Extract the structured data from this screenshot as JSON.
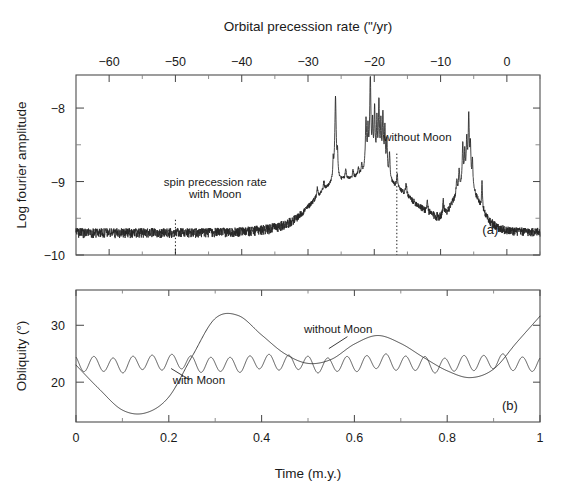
{
  "figure": {
    "top_axis_title": "Orbital precession rate (\"/yr)",
    "bottom_axis_title": "Time (m.y.)",
    "panel_a": {
      "label": "(a)",
      "ylabel": "Log fourier amplitude",
      "annotation_spin_line1": "spin precession rate",
      "annotation_spin_line2": "with Moon",
      "annotation_without_moon": "without Moon"
    },
    "panel_b": {
      "label": "(b)",
      "ylabel": "Obliquity (°)",
      "annotation_with_moon": "with Moon",
      "annotation_without_moon": "without Moon"
    }
  },
  "chart_data": [
    {
      "type": "line",
      "panel": "a",
      "title": "",
      "xlabel": "Orbital precession rate (\"/yr)",
      "ylabel": "Log fourier amplitude",
      "xlim": [
        -65,
        5
      ],
      "ylim": [
        -10,
        -7.55
      ],
      "xticks": [
        -60,
        -50,
        -40,
        -30,
        -20,
        -10,
        0
      ],
      "xtick_labels": [
        "−60",
        "−50",
        "−40",
        "−30",
        "−20",
        "−10",
        "0"
      ],
      "yticks": [
        -8,
        -9,
        -10
      ],
      "ytick_labels": [
        "−8",
        "−9",
        "−10"
      ],
      "yminor": [
        -8.5,
        -9.5
      ],
      "grid": false,
      "legend": null,
      "annotations": [
        {
          "text": "spin precession rate",
          "x": -44.0,
          "y": -9.06
        },
        {
          "text": "with Moon",
          "x": -44.0,
          "y": -9.22
        },
        {
          "text": "without Moon",
          "x": -13.5,
          "y": -8.45
        },
        {
          "text": "(a)",
          "x": -2.5,
          "y": -9.72
        }
      ],
      "vertical_dotted_lines": [
        {
          "name": "spin-precession-with-moon",
          "x": -50.0,
          "y_top": -9.52,
          "y_bottom": -10.0
        },
        {
          "name": "spin-precession-without-moon",
          "x": -16.6,
          "y_top": -8.62,
          "y_bottom": -10.0
        }
      ],
      "series": [
        {
          "name": "fourier-spectrum",
          "comment": "log fourier amplitude of orbital precession spectrum; peak cluster near -26, -21 to -18 and -7 to -5",
          "peaks": [
            {
              "x": -25.8,
              "y": -8.22
            },
            {
              "x": -20.6,
              "y": -7.82
            },
            {
              "x": -19.9,
              "y": -8.35
            },
            {
              "x": -19.2,
              "y": -8.15
            },
            {
              "x": -18.6,
              "y": -8.55
            },
            {
              "x": -6.6,
              "y": -8.7
            },
            {
              "x": -5.7,
              "y": -8.28
            },
            {
              "x": -3.7,
              "y": -9.42
            }
          ],
          "baseline": -10.0
        }
      ]
    },
    {
      "type": "line",
      "panel": "b",
      "title": "",
      "xlabel": "Time (m.y.)",
      "ylabel": "Obliquity (°)",
      "xlim": [
        0,
        1
      ],
      "ylim": [
        13.0,
        36.2
      ],
      "xticks": [
        0,
        0.2,
        0.4,
        0.6,
        0.8,
        1
      ],
      "xtick_labels": [
        "0",
        "0.2",
        "0.4",
        "0.6",
        "0.8",
        "1"
      ],
      "xminor": [
        0.1,
        0.3,
        0.5,
        0.7,
        0.9
      ],
      "yticks": [
        30,
        20
      ],
      "ytick_labels": [
        "30",
        "20"
      ],
      "grid": false,
      "annotations": [
        {
          "text": "with Moon",
          "x": 0.265,
          "y": 19.6
        },
        {
          "text": "without Moon",
          "x": 0.565,
          "y": 28.6
        },
        {
          "text": "(b)",
          "x": 0.935,
          "y": 15.1
        }
      ],
      "series": [
        {
          "name": "without Moon",
          "comment": "large-amplitude chaotic obliquity variation, range ~14.5 to 32 degrees",
          "x": [
            0.0,
            0.05,
            0.1,
            0.15,
            0.2,
            0.25,
            0.3,
            0.35,
            0.4,
            0.45,
            0.5,
            0.55,
            0.6,
            0.65,
            0.7,
            0.75,
            0.8,
            0.85,
            0.9,
            0.95,
            1.0
          ],
          "y": [
            23.0,
            18.8,
            15.1,
            14.6,
            17.4,
            24.5,
            31.2,
            31.7,
            28.3,
            25.0,
            23.3,
            24.0,
            26.7,
            28.2,
            26.8,
            24.3,
            22.0,
            20.8,
            22.3,
            27.0,
            31.6
          ]
        },
        {
          "name": "with Moon",
          "comment": "small-amplitude quasi-periodic oscillation about 23.3 degrees, amplitude ~1.3 degrees, period ~0.042 m.y.",
          "mean": 23.3,
          "amplitude": 1.3,
          "period": 0.042
        }
      ]
    }
  ],
  "geometry": {
    "plot_left": 76,
    "plot_right": 540,
    "panel_a_top": 75,
    "panel_a_bottom": 255,
    "panel_b_top": 290,
    "panel_b_bottom": 422
  }
}
